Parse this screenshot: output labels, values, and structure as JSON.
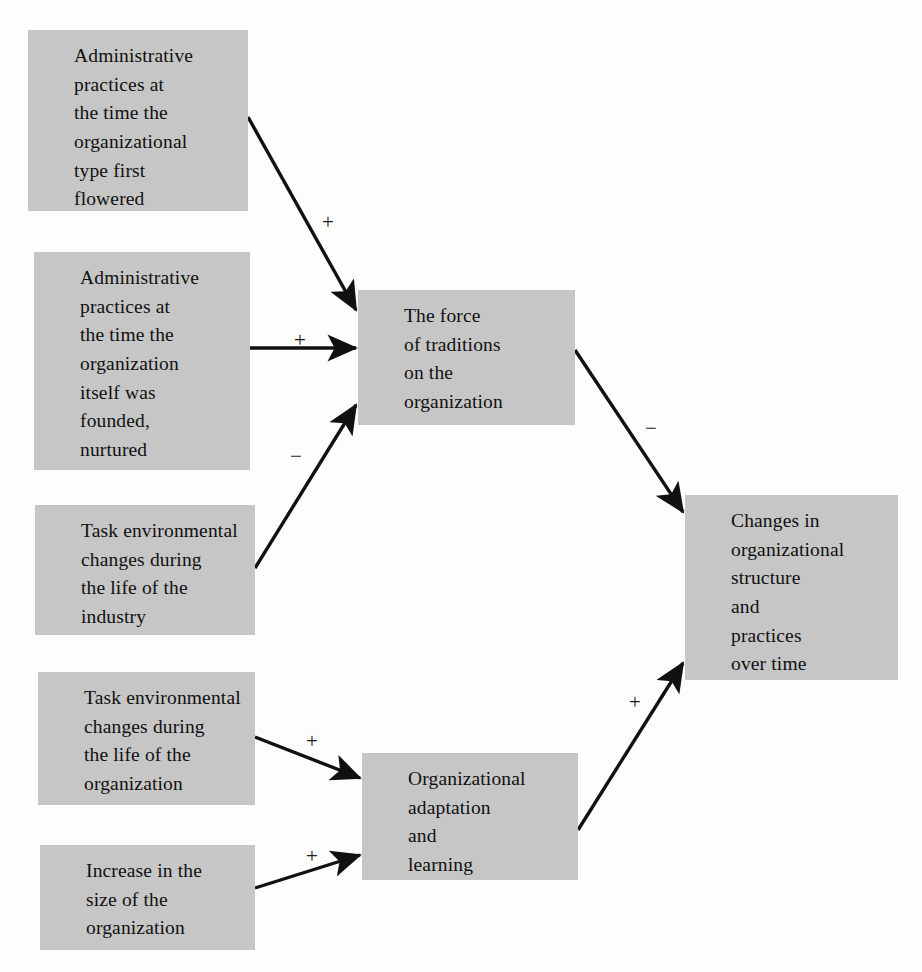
{
  "diagram": {
    "type": "influence-diagram",
    "background_color": "#fdfdfc",
    "node_fill_color": "#c6c6c6",
    "edge_color": "#111111",
    "nodes": [
      {
        "id": "admin-practices-type",
        "label": "Administrative\npractices at\nthe time the\norganizational\ntype first\nflowered",
        "x": 28,
        "y": 30,
        "w": 220,
        "h": 181
      },
      {
        "id": "admin-practices-org",
        "label": "Administrative\npractices at\nthe time the\norganization\nitself was\nfounded,\nnurtured",
        "x": 34,
        "y": 252,
        "w": 216,
        "h": 218
      },
      {
        "id": "task-env-industry",
        "label": "Task environmental\nchanges during\nthe life of the\nindustry",
        "x": 35,
        "y": 505,
        "w": 220,
        "h": 130
      },
      {
        "id": "task-env-organization",
        "label": "Task environmental\nchanges during\nthe life of the\norganization",
        "x": 38,
        "y": 672,
        "w": 217,
        "h": 133
      },
      {
        "id": "increase-size",
        "label": "Increase in the\nsize of the\norganization",
        "x": 40,
        "y": 845,
        "w": 215,
        "h": 105
      },
      {
        "id": "force-of-traditions",
        "label": "The force\nof traditions\non the\norganization",
        "x": 358,
        "y": 290,
        "w": 217,
        "h": 135
      },
      {
        "id": "organizational-adaptation",
        "label": "Organizational\nadaptation\nand\nlearning",
        "x": 362,
        "y": 753,
        "w": 216,
        "h": 127
      },
      {
        "id": "changes-structure-practices",
        "label": "Changes in\norganizational\nstructure\nand\npractices\nover time",
        "x": 685,
        "y": 495,
        "w": 213,
        "h": 185
      }
    ],
    "edges": [
      {
        "id": "edge-type-to-traditions",
        "from": "admin-practices-type",
        "to": "force-of-traditions",
        "sign": "+",
        "x1": 248,
        "y1": 117,
        "x2": 356,
        "y2": 310,
        "label_x": 322,
        "label_y": 212
      },
      {
        "id": "edge-founded-to-traditions",
        "from": "admin-practices-org",
        "to": "force-of-traditions",
        "sign": "+",
        "x1": 250,
        "y1": 348,
        "x2": 356,
        "y2": 348,
        "label_x": 294,
        "label_y": 330
      },
      {
        "id": "edge-industry-to-traditions",
        "from": "task-env-industry",
        "to": "force-of-traditions",
        "sign": "−",
        "x1": 255,
        "y1": 568,
        "x2": 356,
        "y2": 405,
        "label_x": 290,
        "label_y": 446
      },
      {
        "id": "edge-traditions-to-changes",
        "from": "force-of-traditions",
        "to": "changes-structure-practices",
        "sign": "−",
        "x1": 575,
        "y1": 350,
        "x2": 683,
        "y2": 512,
        "label_x": 645,
        "label_y": 418
      },
      {
        "id": "edge-taskenv-org-to-adaptation",
        "from": "task-env-organization",
        "to": "organizational-adaptation",
        "sign": "+",
        "x1": 255,
        "y1": 737,
        "x2": 360,
        "y2": 778,
        "label_x": 306,
        "label_y": 731
      },
      {
        "id": "edge-size-to-adaptation",
        "from": "increase-size",
        "to": "organizational-adaptation",
        "sign": "+",
        "x1": 255,
        "y1": 888,
        "x2": 360,
        "y2": 855,
        "label_x": 306,
        "label_y": 846
      },
      {
        "id": "edge-adaptation-to-changes",
        "from": "organizational-adaptation",
        "to": "changes-structure-practices",
        "sign": "+",
        "x1": 578,
        "y1": 830,
        "x2": 683,
        "y2": 663,
        "label_x": 629,
        "label_y": 692
      }
    ]
  }
}
